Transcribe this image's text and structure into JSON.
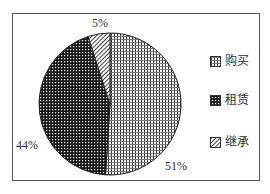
{
  "chart_data": {
    "type": "pie",
    "title": "",
    "categories": [
      "购买",
      "租赁",
      "继承"
    ],
    "values": [
      51,
      44,
      5
    ],
    "labels": [
      "51%",
      "44%",
      "5%"
    ],
    "legend_position": "right",
    "series": [
      {
        "name": "购买",
        "value": 51,
        "pattern": "grid-light"
      },
      {
        "name": "租赁",
        "value": 44,
        "pattern": "grid-dark"
      },
      {
        "name": "继承",
        "value": 5,
        "pattern": "diagonal-hatch"
      }
    ]
  },
  "legend": {
    "items": [
      {
        "label": "购买"
      },
      {
        "label": "租赁"
      },
      {
        "label": "继承"
      }
    ]
  },
  "slice_labels": {
    "buy": "51%",
    "rent": "44%",
    "inherit": "5%"
  },
  "colors": {
    "ink": "#222222",
    "background": "#ffffff"
  }
}
